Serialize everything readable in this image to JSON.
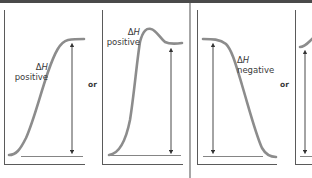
{
  "figure": {
    "panels": [
      {
        "id": "panel-1",
        "delta_symbol": "Δ",
        "variable": "H",
        "sign": "positive",
        "curve": "sigmoid-rise"
      },
      {
        "id": "panel-2",
        "delta_symbol": "Δ",
        "variable": "H",
        "sign": "positive",
        "curve": "rise-with-overshoot"
      },
      {
        "id": "panel-3",
        "delta_symbol": "Δ",
        "variable": "H",
        "sign": "negative",
        "curve": "sigmoid-fall"
      },
      {
        "id": "panel-4",
        "curve": "partial-cut-off"
      }
    ],
    "connectors": {
      "or_left": "or",
      "or_right": "or"
    },
    "colors": {
      "curve": "#8c8c8c",
      "axis": "#5a5a5a",
      "arrow": "#333333",
      "top_bar": "#4a4a4a",
      "text": "#3a3a3a"
    }
  }
}
